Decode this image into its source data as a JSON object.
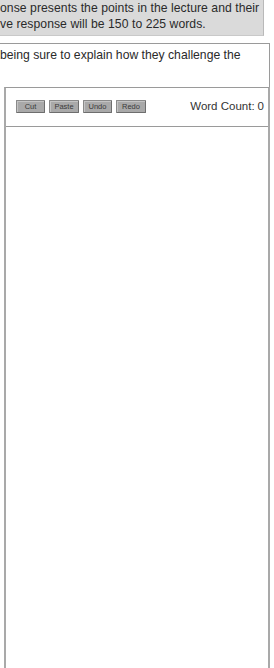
{
  "directions": {
    "line1": "onse presents the points in the lecture and their",
    "line2": "ve response will be 150 to 225 words."
  },
  "question": {
    "prompt": "being sure to explain how they challenge the"
  },
  "toolbar": {
    "cut_label": "Cut",
    "paste_label": "Paste",
    "undo_label": "Undo",
    "redo_label": "Redo",
    "word_count_label": "Word Count:",
    "word_count_value": "0"
  },
  "editor": {
    "value": "",
    "placeholder": ""
  },
  "colors": {
    "directions_bg": "#dadada",
    "button_bg": "#a9a9a9",
    "border": "#9a9a9a"
  }
}
